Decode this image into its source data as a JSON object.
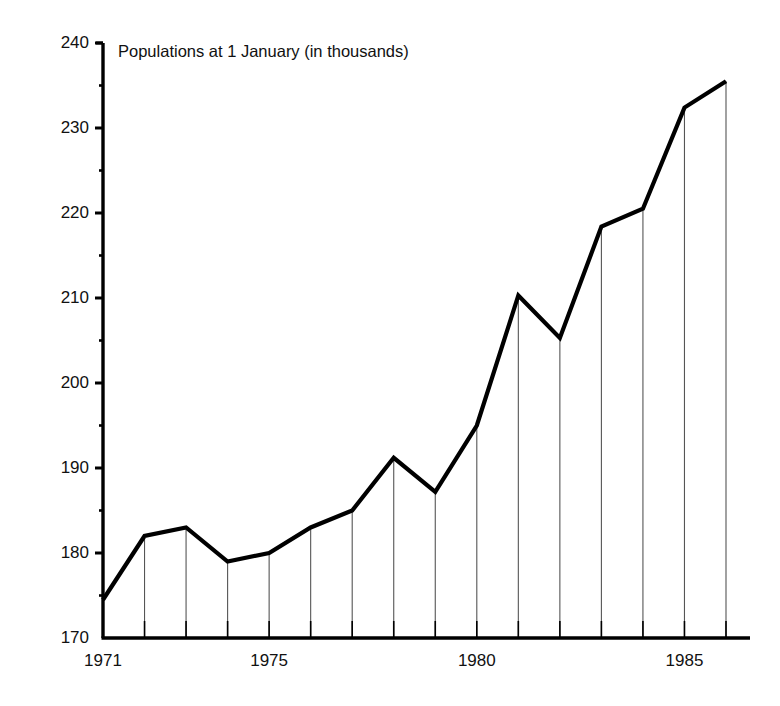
{
  "chart_data": {
    "type": "line",
    "title": "Populations at 1 January (in thousands)",
    "xlabel": "",
    "ylabel": "",
    "ylim": [
      170,
      240
    ],
    "xlim": [
      1971,
      1986
    ],
    "ytick_values": [
      170,
      180,
      190,
      200,
      210,
      220,
      230,
      240
    ],
    "ytick_labels": [
      "170",
      "180",
      "190",
      "200",
      "210",
      "220",
      "230",
      "240"
    ],
    "yminor_step": 5,
    "xtick_values": [
      1971,
      1975,
      1980,
      1985
    ],
    "xtick_labels": [
      "1971",
      "1975",
      "1980",
      "1985"
    ],
    "x": [
      1971,
      1972,
      1973,
      1974,
      1975,
      1976,
      1977,
      1978,
      1979,
      1980,
      1981,
      1982,
      1983,
      1984,
      1985,
      1986
    ],
    "values": [
      174.5,
      182.0,
      183.0,
      179.0,
      180.0,
      183.0,
      185.0,
      191.2,
      187.2,
      195.0,
      210.3,
      205.3,
      218.4,
      220.5,
      232.4,
      235.5
    ],
    "series": [
      {
        "name": "Populations at 1 January (in thousands)",
        "values": [
          174.5,
          182.0,
          183.0,
          179.0,
          180.0,
          183.0,
          185.0,
          191.2,
          187.2,
          195.0,
          210.3,
          205.3,
          218.4,
          220.5,
          232.4,
          235.5
        ]
      }
    ],
    "grid": "vertical-droplines",
    "legend": "none",
    "line_color": "#000000",
    "dropline_color": "#555555",
    "axis_color": "#000000"
  },
  "geometry": {
    "plot_left": 103,
    "plot_right": 726,
    "plot_top": 43,
    "plot_bottom": 638
  }
}
